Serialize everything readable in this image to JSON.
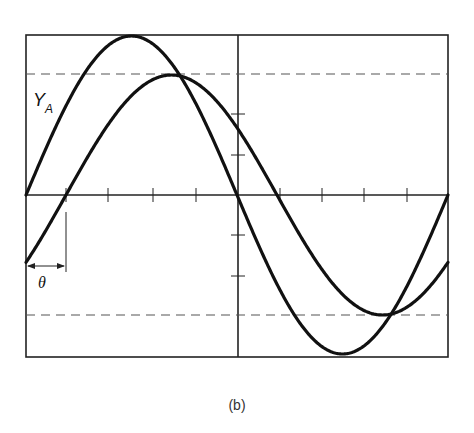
{
  "figure": {
    "caption": "(b)",
    "curve_label_main": "Y",
    "curve_label_sub": "A",
    "phase_label": "θ"
  },
  "colors": {
    "ink": "#111111",
    "frame": "#222222",
    "dashed": "#555555",
    "background": "#ffffff"
  },
  "plot": {
    "frame": {
      "x0": 26,
      "y0": 35,
      "x1": 448,
      "y1": 357
    },
    "axis_y": 195,
    "axis_x": 238,
    "x_ticks": [
      66,
      108,
      153,
      196,
      280,
      322,
      364,
      407
    ],
    "y_ticks": [
      114,
      155,
      235,
      276
    ],
    "dashed_levels": [
      74,
      315
    ],
    "half_period_px": 211,
    "curves": [
      {
        "name": "Y_A",
        "amplitude_px": 159,
        "phase_shift_px": 0
      },
      {
        "name": "Y_B",
        "amplitude_px": 120,
        "phase_shift_px": 40
      }
    ],
    "theta_marker": {
      "x_start": 26,
      "x_end": 66,
      "arrow_y": 266,
      "line_top": 212,
      "line_bottom": 272
    }
  }
}
